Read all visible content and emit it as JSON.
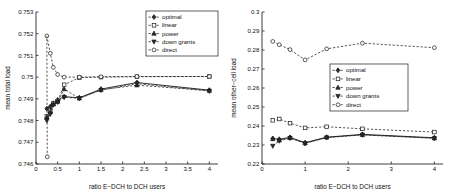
{
  "figure": {
    "panel_count": 2,
    "background": "#ffffff",
    "series_color": "#1a1a1a"
  },
  "chart_data": [
    {
      "id": "left",
      "type": "line",
      "title": "",
      "xlabel": "ratio E−DCH to DCH users",
      "ylabel": "mean total load",
      "xlim": [
        0,
        4.2
      ],
      "ylim": [
        0.746,
        0.753
      ],
      "xticks": [
        0,
        0.5,
        1,
        1.5,
        2,
        2.5,
        3,
        3.5,
        4
      ],
      "xticklabels": [
        "0",
        "0.5",
        "1",
        "1.5",
        "2",
        "2.5",
        "3",
        "3.5",
        "4"
      ],
      "yticks": [
        0.746,
        0.747,
        0.748,
        0.749,
        0.75,
        0.751,
        0.752,
        0.753
      ],
      "yticklabels": [
        "0.746",
        "0.747",
        "0.748",
        "0.749",
        "0.75",
        "0.751",
        "0.752",
        "0.753"
      ],
      "grid": false,
      "legend_position": "top-right",
      "x": [
        0.25,
        0.33,
        0.4,
        0.5,
        0.65,
        1.0,
        1.5,
        2.33,
        4.0
      ],
      "series": [
        {
          "name": "optimal",
          "marker": "diamond",
          "linestyle": "solid",
          "values": [
            0.74855,
            0.74865,
            0.7488,
            0.74895,
            0.7491,
            0.74905,
            0.74945,
            0.74975,
            0.7494
          ]
        },
        {
          "name": "linear",
          "marker": "square",
          "linestyle": "dashed",
          "values": [
            0.7482,
            0.74845,
            0.74878,
            0.7489,
            0.74965,
            0.74998,
            0.75,
            0.75002,
            0.75003
          ]
        },
        {
          "name": "power",
          "marker": "triangle-up",
          "linestyle": "dashed",
          "values": [
            0.74815,
            0.7484,
            0.74875,
            0.74888,
            0.74945,
            0.74903,
            0.74942,
            0.74963,
            0.74938
          ]
        },
        {
          "name": "down grants",
          "marker": "triangle-down",
          "linestyle": "dashed",
          "values": [
            0.748,
            0.7483,
            0.74872,
            0.74885,
            0.74908,
            0.74902,
            0.7494,
            0.7497,
            0.74936
          ]
        },
        {
          "name": "direct",
          "marker": "hexagram",
          "linestyle": "dashed",
          "values": [
            0.7519,
            0.7511,
            0.75045,
            0.75012,
            0.75,
            0.75,
            0.75002,
            0.75003,
            0.75003
          ]
        }
      ],
      "extra_points": [
        {
          "series": "direct",
          "x": 0.26,
          "y": 0.74633
        }
      ]
    },
    {
      "id": "right",
      "type": "line",
      "title": "",
      "xlabel": "ratio E−DCH to DCH users",
      "ylabel": "mean other−cell load",
      "xlim": [
        0,
        4.2
      ],
      "ylim": [
        0.22,
        0.3
      ],
      "xticks": [
        0,
        1,
        2,
        3,
        4
      ],
      "xticklabels": [
        "0",
        "1",
        "2",
        "3",
        "4"
      ],
      "yticks": [
        0.22,
        0.23,
        0.24,
        0.25,
        0.26,
        0.27,
        0.28,
        0.29,
        0.3
      ],
      "yticklabels": [
        "0.22",
        "0.23",
        "0.24",
        "0.25",
        "0.26",
        "0.27",
        "0.28",
        "0.29",
        "0.3"
      ],
      "grid": false,
      "legend_position": "middle-right",
      "x": [
        0.25,
        0.4,
        0.65,
        1.0,
        1.5,
        2.33,
        4.0
      ],
      "series": [
        {
          "name": "optimal",
          "marker": "diamond",
          "linestyle": "solid",
          "values": [
            0.2334,
            0.233,
            0.234,
            0.2312,
            0.2341,
            0.2356,
            0.2338
          ]
        },
        {
          "name": "linear",
          "marker": "square",
          "linestyle": "dashed",
          "values": [
            0.243,
            0.2437,
            0.2415,
            0.239,
            0.2396,
            0.2385,
            0.2368
          ]
        },
        {
          "name": "power",
          "marker": "triangle-up",
          "linestyle": "dashed",
          "values": [
            0.2332,
            0.2325,
            0.2338,
            0.231,
            0.234,
            0.2354,
            0.2336
          ]
        },
        {
          "name": "down grants",
          "marker": "triangle-down",
          "linestyle": "dashed",
          "values": [
            0.2295,
            0.2322,
            0.2336,
            0.2308,
            0.2339,
            0.2353,
            0.2335
          ]
        },
        {
          "name": "direct",
          "marker": "hexagram",
          "linestyle": "dashed",
          "values": [
            0.2845,
            0.2828,
            0.2802,
            0.2748,
            0.2806,
            0.2836,
            0.2812
          ]
        }
      ]
    }
  ],
  "legend": {
    "entries": [
      {
        "label": "optimal",
        "marker": "diamond"
      },
      {
        "label": "linear",
        "marker": "square"
      },
      {
        "label": "power",
        "marker": "triangle-up"
      },
      {
        "label": "down grants",
        "marker": "triangle-down"
      },
      {
        "label": "direct",
        "marker": "hexagram"
      }
    ]
  }
}
